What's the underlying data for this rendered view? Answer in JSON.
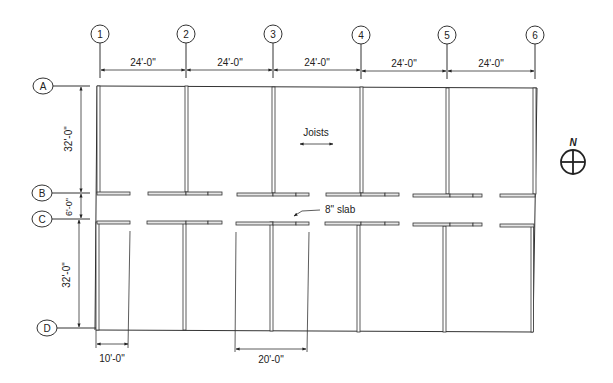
{
  "plan": {
    "title": "Structural framing plan",
    "column_grid": [
      "1",
      "2",
      "3",
      "4",
      "5",
      "6"
    ],
    "row_grid": [
      "A",
      "B",
      "C",
      "D"
    ],
    "bay_widths": [
      "24'-0\"",
      "24'-0\"",
      "24'-0\"",
      "24'-0\"",
      "24'-0\""
    ],
    "row_dims": {
      "ab": "32'-0\"",
      "bc": "6'-0\"",
      "cd": "32'-0\""
    },
    "bottom_dims": {
      "left": "10'-0\"",
      "middle": "20'-0\""
    },
    "labels": {
      "joists": "Joists",
      "slab": "8\" slab",
      "north": "N"
    }
  }
}
